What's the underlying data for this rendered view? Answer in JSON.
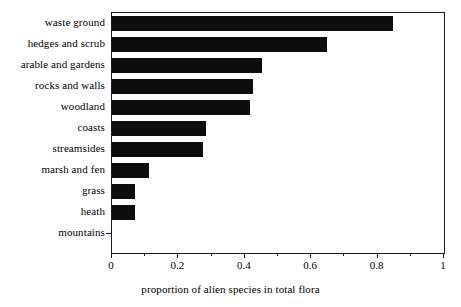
{
  "chart_data": {
    "type": "bar",
    "orientation": "horizontal",
    "title": "",
    "xlabel": "proportion of alien species in total flora",
    "ylabel": "",
    "xlim": [
      0,
      1
    ],
    "grid": false,
    "legend": "none",
    "bar_color": "#0d0d0d",
    "axis_color": "#1a1a1a",
    "categories": [
      "waste ground",
      "hedges and scrub",
      "arable and gardens",
      "rocks and walls",
      "woodland",
      "coasts",
      "streamsides",
      "marsh and fen",
      "grass",
      "heath",
      "mountains"
    ],
    "values": [
      0.846,
      0.648,
      0.452,
      0.425,
      0.415,
      0.283,
      0.275,
      0.111,
      0.068,
      0.068,
      0.0
    ],
    "xticks": [
      0,
      0.2,
      0.4,
      0.6,
      0.8,
      1
    ],
    "xtick_labels": [
      "0",
      "0.2",
      "0.4",
      "0.6",
      "0.8",
      "1"
    ],
    "xminor_ticks": [
      0.1,
      0.3,
      0.5,
      0.7,
      0.9
    ]
  }
}
